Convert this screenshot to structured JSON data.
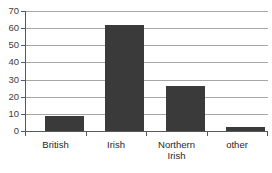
{
  "chart_data": {
    "type": "bar",
    "title": "",
    "xlabel": "",
    "ylabel": "",
    "categories": [
      "British",
      "Irish",
      "Northern Irish",
      "other"
    ],
    "values": [
      9,
      62,
      26,
      2.5
    ],
    "ylim": [
      0,
      70
    ],
    "yticks": [
      0,
      10,
      20,
      30,
      40,
      50,
      60,
      70
    ],
    "ytick_labels": [
      "0",
      "10",
      "20",
      "30",
      "40",
      "50",
      "60",
      "70"
    ],
    "grid": true,
    "legend": false,
    "legend_position": "none",
    "series": [
      {
        "name": "",
        "values": [
          9,
          62,
          26,
          2.5
        ]
      }
    ]
  },
  "axes": {
    "y": {
      "ticks": [
        {
          "label": "70",
          "value": 70
        },
        {
          "label": "60",
          "value": 60
        },
        {
          "label": "50",
          "value": 50
        },
        {
          "label": "40",
          "value": 40
        },
        {
          "label": "30",
          "value": 30
        },
        {
          "label": "20",
          "value": 20
        },
        {
          "label": "10",
          "value": 10
        },
        {
          "label": "0",
          "value": 0
        }
      ]
    },
    "x": {
      "labels": [
        {
          "text": "British"
        },
        {
          "text": "Irish"
        },
        {
          "text": "Northern\nIrish"
        },
        {
          "text": "other"
        }
      ]
    }
  },
  "colors": {
    "bar": "#3a3a3a",
    "gridline": "#a6a6a6",
    "axis": "#595959",
    "tick_text": "#404040",
    "label_text": "#262626",
    "background": "#ffffff"
  },
  "top_clipped_text": ""
}
